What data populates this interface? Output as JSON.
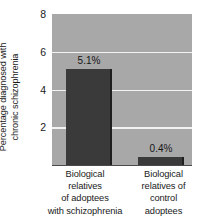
{
  "chart_data": {
    "type": "bar",
    "title": "",
    "subtitle": "",
    "xlabel": "",
    "ylabel": "Percentage diagnosed with\nchronic schizophrenia",
    "categories": [
      "Biological\nrelatives\nof adoptees\nwith schizophrenia",
      "Biological\nrelatives of\ncontrol\nadoptees"
    ],
    "values": [
      5.1,
      0.4
    ],
    "value_labels": [
      "5.1%",
      "0.4%"
    ],
    "ylim": [
      0,
      8
    ],
    "yticks": [
      2,
      4,
      6,
      8
    ],
    "ytick_labels": [
      "2",
      "4",
      "6",
      "8"
    ],
    "grid": true,
    "gridlines_at": [
      2,
      4,
      6,
      8
    ],
    "legend": "none",
    "colors": {
      "plot_background": "#a8a8a8",
      "bar": "#3a3a3a",
      "bar_edge": "#1f1f1f",
      "gridline": "#f2f2f2",
      "axis": "#4a4a4a",
      "text": "#1a1a1a",
      "page_background": "#ffffff"
    }
  }
}
